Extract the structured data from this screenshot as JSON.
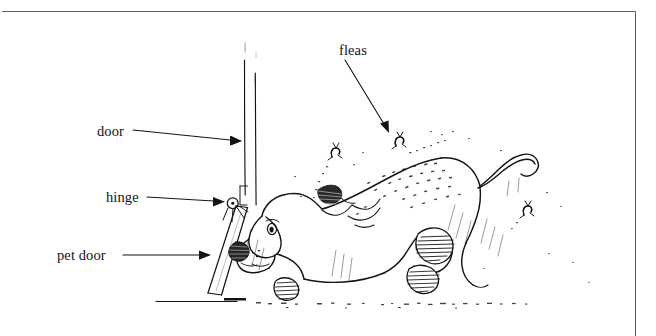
{
  "figure": {
    "kind": "line-drawing-illustration",
    "background_color": "#ffffff",
    "ink_color": "#141414",
    "frame_color": "#5d6066",
    "width": 656,
    "height": 336
  },
  "labels": [
    {
      "id": "door",
      "text": "door",
      "x": 97,
      "y": 124,
      "arrow_to": [
        244,
        141
      ]
    },
    {
      "id": "hinge",
      "text": "hinge",
      "x": 106,
      "y": 190,
      "arrow_to": [
        227,
        202
      ]
    },
    {
      "id": "pet_door",
      "text": "pet door",
      "x": 57,
      "y": 248,
      "arrow_to": [
        213,
        255
      ]
    },
    {
      "id": "fleas",
      "text": "fleas",
      "x": 339,
      "y": 43,
      "arrow_to": [
        390,
        133
      ]
    }
  ],
  "callout_arrows": [
    {
      "for": "door",
      "from": [
        133,
        131
      ],
      "to": [
        244,
        141
      ]
    },
    {
      "for": "hinge",
      "from": [
        147,
        197
      ],
      "to": [
        226,
        202
      ]
    },
    {
      "for": "pet_door",
      "from": [
        123,
        255
      ],
      "to": [
        213,
        255
      ]
    },
    {
      "for": "fleas",
      "from": [
        345,
        59
      ],
      "to": [
        390,
        133
      ]
    }
  ],
  "parts": {
    "door_panel": {
      "name": "door",
      "description": "tall vertical door edge, two parallel lines"
    },
    "hinge_pivot": {
      "name": "hinge",
      "description": "small circle with centre dot at the pet-door pivot"
    },
    "pet_door_flap": {
      "name": "pet door",
      "description": "slanted rectangular flap swung open to the left"
    },
    "floor_line": {
      "name": "floor",
      "description": "horizontal ground line with dotted dust trail"
    },
    "dog": {
      "name": "dog",
      "description": "long-eared dog, head down, tail curled up, stippled fur, hatched paws"
    },
    "fleas_swarm": {
      "name": "fleas",
      "count": 3,
      "description": "tiny insects with dotted jump trails leaving the dog"
    }
  }
}
